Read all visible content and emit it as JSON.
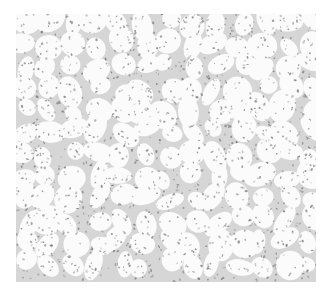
{
  "image": {
    "subject": "grayscale histology micrograph of tissue with glandular/alveolar spaces and scattered stained nuclei",
    "region": {
      "x": 16,
      "y": 14,
      "width": 300,
      "height": 268
    },
    "colors": {
      "page_background": "#ffffff",
      "tissue_background": "#f4f4f4",
      "lumen": "#fbfbfb",
      "stroma": "#d6d6d6",
      "nucleus": "#6e6e6e"
    }
  }
}
